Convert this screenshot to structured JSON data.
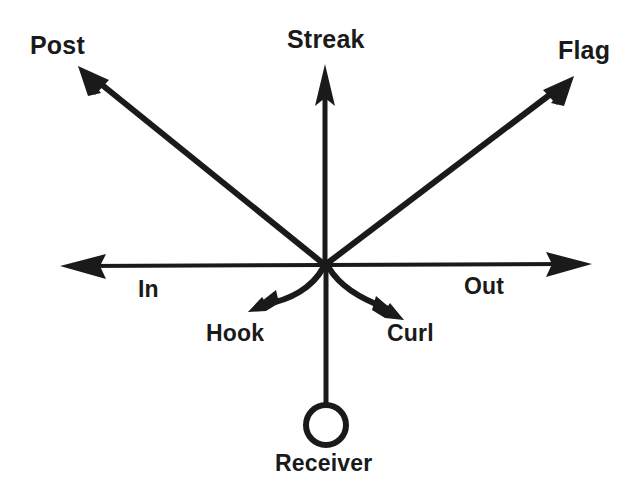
{
  "diagram": {
    "origin": {
      "x": 325,
      "y": 265
    },
    "stroke_color": "#1a1a1a",
    "background_color": "#ffffff",
    "player": {
      "name": "Receiver",
      "label": "Receiver",
      "marker": "open-circle",
      "position": {
        "x": 326,
        "y": 425
      },
      "radius": 20
    },
    "routes": [
      {
        "id": "post",
        "label": "Post",
        "kind": "straight-arrow",
        "direction": "up-left",
        "angle_deg": 141,
        "tip": {
          "x": 78,
          "y": 66
        }
      },
      {
        "id": "streak",
        "label": "Streak",
        "kind": "straight-arrow",
        "direction": "up",
        "angle_deg": 90,
        "tip": {
          "x": 325,
          "y": 64
        }
      },
      {
        "id": "flag",
        "label": "Flag",
        "kind": "straight-arrow",
        "direction": "up-right",
        "angle_deg": 37,
        "tip": {
          "x": 574,
          "y": 76
        }
      },
      {
        "id": "in",
        "label": "In",
        "kind": "straight-arrow",
        "direction": "left",
        "angle_deg": 180,
        "tip": {
          "x": 60,
          "y": 266
        }
      },
      {
        "id": "out",
        "label": "Out",
        "kind": "straight-arrow",
        "direction": "right",
        "angle_deg": 0,
        "tip": {
          "x": 592,
          "y": 264
        }
      },
      {
        "id": "hook",
        "label": "Hook",
        "kind": "curved-arrow",
        "direction": "down-left",
        "tip": {
          "x": 248,
          "y": 312
        }
      },
      {
        "id": "curl",
        "label": "Curl",
        "kind": "curved-arrow",
        "direction": "down-right",
        "tip": {
          "x": 404,
          "y": 320
        }
      }
    ]
  }
}
